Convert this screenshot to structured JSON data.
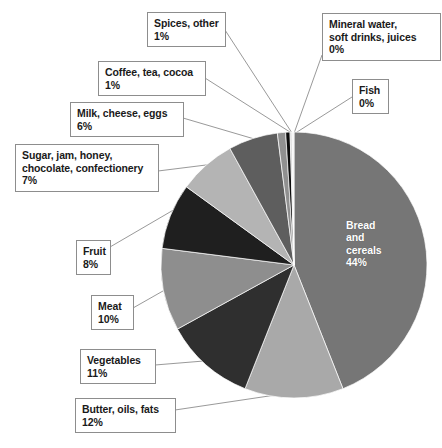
{
  "chart_data": {
    "type": "pie",
    "title": "",
    "subtitle": "",
    "xlabel": "",
    "ylabel": "",
    "legend_position": "callout-labels",
    "grid": false,
    "total_label": "100%",
    "units": "percent",
    "categories": [
      "Bread and cereals",
      "Butter, oils, fats",
      "Vegetables",
      "Meat",
      "Fruit",
      "Sugar, jam, honey, chocolate, confectionery",
      "Milk, cheese, eggs",
      "Coffee, tea, cocoa",
      "Spices, other",
      "Fish",
      "Mineral water, soft drinks, juices"
    ],
    "values": [
      44,
      12,
      11,
      10,
      8,
      7,
      6,
      1,
      1,
      0,
      0
    ],
    "value_labels": [
      "44%",
      "12%",
      "11%",
      "10%",
      "8%",
      "7%",
      "6%",
      "1%",
      "1%",
      "0%",
      "0%"
    ],
    "colors": [
      "#767676",
      "#a9a9a9",
      "#2f2f2f",
      "#8e8e8e",
      "#1f1f1f",
      "#b4b4b4",
      "#5e5e5e",
      "#909090",
      "#0b0b0b",
      "#c8c8c8",
      "#f2f2f2"
    ],
    "slices": [
      {
        "name": "Bread and cereals",
        "value": 44,
        "label": "44%",
        "color": "#767676",
        "start_deg": 0,
        "end_deg": 158.4
      },
      {
        "name": "Butter, oils, fats",
        "value": 12,
        "label": "12%",
        "color": "#a9a9a9",
        "start_deg": 158.4,
        "end_deg": 201.6
      },
      {
        "name": "Vegetables",
        "value": 11,
        "label": "11%",
        "color": "#2f2f2f",
        "start_deg": 201.6,
        "end_deg": 241.2
      },
      {
        "name": "Meat",
        "value": 10,
        "label": "10%",
        "color": "#8e8e8e",
        "start_deg": 241.2,
        "end_deg": 277.2
      },
      {
        "name": "Fruit",
        "value": 8,
        "label": "8%",
        "color": "#1f1f1f",
        "start_deg": 277.2,
        "end_deg": 306.0
      },
      {
        "name": "Sugar, jam, honey, chocolate, confectionery",
        "value": 7,
        "label": "7%",
        "color": "#b4b4b4",
        "start_deg": 306.0,
        "end_deg": 331.2
      },
      {
        "name": "Milk, cheese, eggs",
        "value": 6,
        "label": "6%",
        "color": "#5e5e5e",
        "start_deg": 331.2,
        "end_deg": 352.8
      },
      {
        "name": "Coffee, tea, cocoa",
        "value": 1,
        "label": "1%",
        "color": "#909090",
        "start_deg": 352.8,
        "end_deg": 356.4
      },
      {
        "name": "Spices, other",
        "value": 1,
        "label": "1%",
        "color": "#0b0b0b",
        "start_deg": 356.4,
        "end_deg": 358.3
      },
      {
        "name": "Fish",
        "value": 0,
        "label": "0%",
        "color": "#c8c8c8",
        "start_deg": 358.3,
        "end_deg": 359.1
      },
      {
        "name": "Mineral water, soft drinks, juices",
        "value": 0,
        "label": "0%",
        "color": "#f2f2f2",
        "start_deg": 359.1,
        "end_deg": 360
      }
    ]
  },
  "inner_labels": [
    {
      "text": "Bread\nand\ncereals\n44%"
    }
  ],
  "callouts": [
    {
      "id": "spices-other",
      "text": "Spices, other\n1%"
    },
    {
      "id": "mineral-water",
      "text": "Mineral water,\nsoft drinks, juices\n0%"
    },
    {
      "id": "coffee-tea-cocoa",
      "text": "Coffee, tea, cocoa\n1%"
    },
    {
      "id": "fish",
      "text": "Fish\n0%"
    },
    {
      "id": "milk-cheese-eggs",
      "text": "Milk, cheese, eggs\n6%"
    },
    {
      "id": "sugar-jam-honey",
      "text": "Sugar, jam, honey,\nchocolate, confectionery\n7%"
    },
    {
      "id": "fruit",
      "text": "Fruit\n8%"
    },
    {
      "id": "meat",
      "text": "Meat\n10%"
    },
    {
      "id": "vegetables",
      "text": "Vegetables\n11%"
    },
    {
      "id": "butter-oils-fats",
      "text": "Butter, oils, fats\n12%"
    }
  ],
  "style": {
    "background": "#ffffff",
    "leader_line_color": "#8d8d8d",
    "box_border_color": "#8d8d8d",
    "text_color": "#1a1a1a",
    "inner_text_color": "#ffffff"
  }
}
